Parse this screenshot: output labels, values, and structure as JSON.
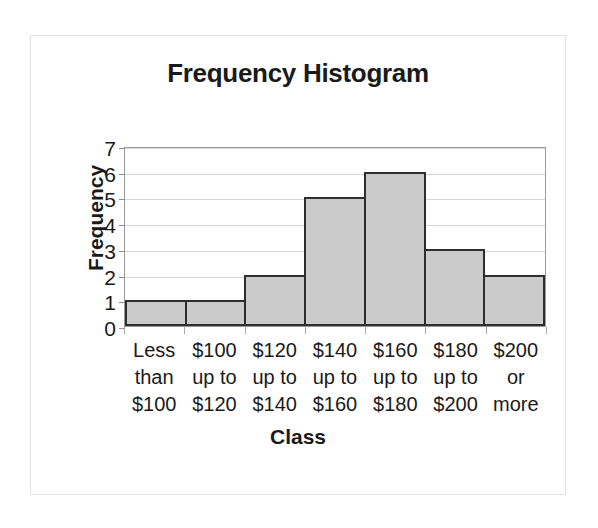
{
  "chart_data": {
    "type": "bar",
    "title": "Frequency Histogram",
    "xlabel": "Class",
    "ylabel": "Frequency",
    "categories": [
      "Less than $100",
      "$100 up to $120",
      "$120 up to $140",
      "$140 up to $160",
      "$160 up to $180",
      "$180 up to $200",
      "$200 or more"
    ],
    "category_lines": [
      [
        "Less",
        "than",
        "$100"
      ],
      [
        "$100",
        "up to",
        "$120"
      ],
      [
        "$120",
        "up to",
        "$140"
      ],
      [
        "$140",
        "up to",
        "$160"
      ],
      [
        "$160",
        "up to",
        "$180"
      ],
      [
        "$180",
        "up to",
        "$200"
      ],
      [
        "$200",
        "or",
        "more"
      ]
    ],
    "values": [
      1,
      1,
      2,
      5,
      6,
      3,
      2
    ],
    "ylim": [
      0,
      7
    ],
    "ytick_labels": [
      "7",
      "6",
      "5",
      "4",
      "3",
      "2",
      "1",
      "0"
    ],
    "ytick_values": [
      7,
      6,
      5,
      4,
      3,
      2,
      1,
      0
    ],
    "grid": true,
    "grid_axis": "y",
    "legend": false,
    "bar_fill_color": "#cbcbcb",
    "bar_border_color": "#2e2e2e",
    "gridline_color": "#d6d6d6",
    "plot_border_color": "#9a9a9a",
    "frame_border_color": "#e2e2e2",
    "text_color": "#1a1a1a",
    "background_color": "#ffffff"
  }
}
